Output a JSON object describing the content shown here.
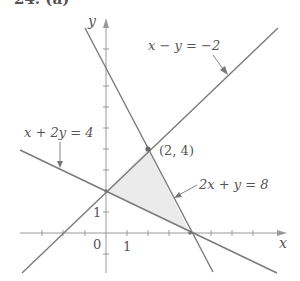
{
  "header": {
    "problem_label": "24. (a)"
  },
  "axes": {
    "x_label": "x",
    "y_label": "y",
    "origin_label": "0",
    "x_tick_label": "1",
    "y_tick_label": "1"
  },
  "lines": [
    {
      "equation": "x + 2y = 4",
      "color": "#777777"
    },
    {
      "equation": "x − y = −2",
      "color": "#777777"
    },
    {
      "equation": "2x + y = 8",
      "color": "#777777"
    }
  ],
  "points": [
    {
      "label": "(2, 4)",
      "x": 2,
      "y": 4
    }
  ],
  "region": {
    "description": "feasible triangle",
    "vertices": [
      [
        0,
        2
      ],
      [
        2,
        4
      ],
      [
        4,
        0
      ]
    ],
    "fill": "#ebebeb"
  },
  "colors": {
    "axis": "#999999",
    "line": "#7a7a7a",
    "text": "#555555"
  }
}
